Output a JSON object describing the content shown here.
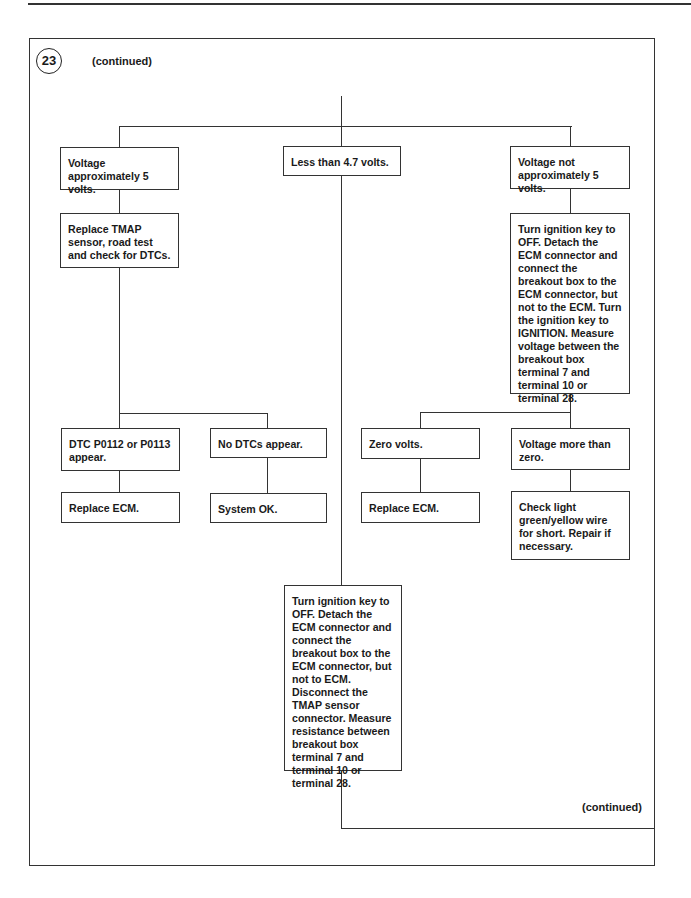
{
  "page": {
    "step_number": "23",
    "continued_top": "(continued)",
    "continued_bottom": "(continued)"
  },
  "flowchart": {
    "nodes": {
      "voltage_approx_5": "Voltage approximately 5 volts.",
      "less_than_4_7": "Less than 4.7 volts.",
      "voltage_not_approx_5": "Voltage not approximately 5 volts.",
      "replace_tmap": "Replace TMAP sensor, road test and check for DTCs.",
      "measure_voltage_breakout": "Turn ignition key to OFF. Detach the ECM connector and connect the breakout box to the ECM connector, but not to the ECM. Turn the ignition key to IGNITION. Measure voltage between the breakout box terminal 7 and terminal 10 or terminal 28.",
      "dtc_p0112_p0113": "DTC P0112 or P0113 appear.",
      "no_dtcs": "No DTCs appear.",
      "zero_volts": "Zero volts.",
      "voltage_more_than_zero": "Voltage more than zero.",
      "replace_ecm_left": "Replace ECM.",
      "system_ok": "System OK.",
      "replace_ecm_right": "Replace ECM.",
      "check_wire": "Check light green/yellow wire for short. Repair if necessary.",
      "measure_resistance": "Turn ignition key to OFF. Detach the ECM connector and connect the breakout box to the ECM connector, but not to ECM. Disconnect the TMAP sensor connector. Measure resistance between breakout box terminal 7 and terminal 10 or terminal 28."
    },
    "edges": [
      [
        "start",
        "voltage_approx_5"
      ],
      [
        "start",
        "less_than_4_7"
      ],
      [
        "start",
        "voltage_not_approx_5"
      ],
      [
        "voltage_approx_5",
        "replace_tmap"
      ],
      [
        "replace_tmap",
        "dtc_p0112_p0113"
      ],
      [
        "replace_tmap",
        "no_dtcs"
      ],
      [
        "dtc_p0112_p0113",
        "replace_ecm_left"
      ],
      [
        "no_dtcs",
        "system_ok"
      ],
      [
        "voltage_not_approx_5",
        "measure_voltage_breakout"
      ],
      [
        "measure_voltage_breakout",
        "zero_volts"
      ],
      [
        "measure_voltage_breakout",
        "voltage_more_than_zero"
      ],
      [
        "zero_volts",
        "replace_ecm_right"
      ],
      [
        "voltage_more_than_zero",
        "check_wire"
      ],
      [
        "less_than_4_7",
        "measure_resistance"
      ],
      [
        "measure_resistance",
        "continued"
      ]
    ]
  }
}
